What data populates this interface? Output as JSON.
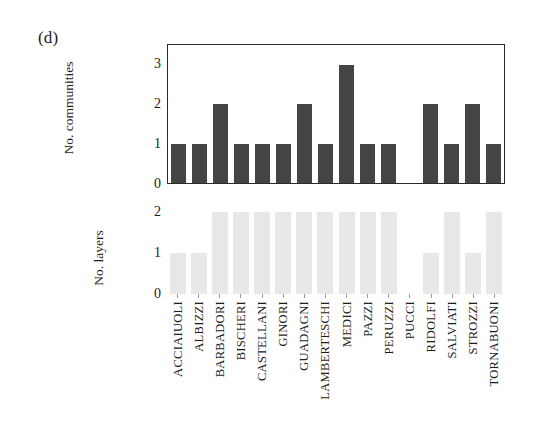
{
  "figure": {
    "panel_label": "(d)"
  },
  "chart_data": [
    {
      "type": "bar",
      "title": "",
      "xlabel": "",
      "ylabel": "No. communities",
      "ylim": [
        0,
        3.5
      ],
      "yticks": [
        "0",
        "1",
        "2",
        "3"
      ],
      "grid": false,
      "legend": "none",
      "bar_color": "#444444",
      "categories": [
        "ACCIAIUOLI",
        "ALBIZZI",
        "BARBADORI",
        "BISCHERI",
        "CASTELLANI",
        "GINORI",
        "GUADAGNI",
        "LAMBERTESCHI",
        "MEDICI",
        "PAZZI",
        "PERUZZI",
        "PUCCI",
        "RIDOLFI",
        "SALVIATI",
        "STROZZI",
        "TORNABUONI"
      ],
      "values": [
        1,
        1,
        2,
        1,
        1,
        1,
        2,
        1,
        3,
        1,
        1,
        0,
        2,
        1,
        2,
        1
      ]
    },
    {
      "type": "bar",
      "title": "",
      "xlabel": "",
      "ylabel": "No. layers",
      "ylim": [
        0,
        2
      ],
      "yticks": [
        "0",
        "1",
        "2"
      ],
      "grid": false,
      "legend": "none",
      "bar_color": "#e8e8e8",
      "categories": [
        "ACCIAIUOLI",
        "ALBIZZI",
        "BARBADORI",
        "BISCHERI",
        "CASTELLANI",
        "GINORI",
        "GUADAGNI",
        "LAMBERTESCHI",
        "MEDICI",
        "PAZZI",
        "PERUZZI",
        "PUCCI",
        "RIDOLFI",
        "SALVIATI",
        "STROZZI",
        "TORNABUONI"
      ],
      "values": [
        1,
        1,
        2,
        2,
        2,
        2,
        2,
        2,
        2,
        2,
        2,
        0,
        1,
        2,
        1,
        2
      ]
    }
  ]
}
